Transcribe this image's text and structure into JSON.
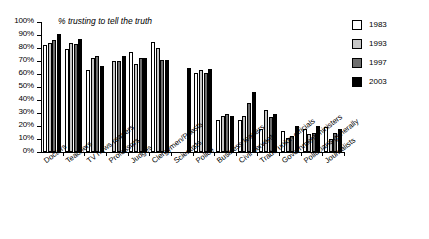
{
  "chart_data": {
    "type": "bar",
    "title": "% trusting to tell the truth",
    "xlabel": "",
    "ylabel": "",
    "ylim": [
      0,
      100
    ],
    "ytick_labels": [
      "100%",
      "90%",
      "80%",
      "70%",
      "60%",
      "50%",
      "40%",
      "30%",
      "20%",
      "10%",
      "0%"
    ],
    "ytick_values": [
      100,
      90,
      80,
      70,
      60,
      50,
      40,
      30,
      20,
      10,
      0
    ],
    "grid": false,
    "legend_position": "top-right",
    "categories": [
      "Doctors",
      "Teachers",
      "TV news readers",
      "Professors",
      "Judges",
      "Clergymen/Priests",
      "Scientists",
      "Police",
      "Business leaders",
      "Civil servants",
      "Trade union officials",
      "Government ministers",
      "Politicians generally",
      "Journalists"
    ],
    "series": [
      {
        "name": "1983",
        "color": "#ffffff",
        "values": [
          82,
          79,
          63,
          null,
          77,
          85,
          null,
          61,
          25,
          25,
          18,
          16,
          18,
          19
        ]
      },
      {
        "name": "1993",
        "color": "#c6c6c6",
        "values": [
          84,
          84,
          72,
          70,
          68,
          80,
          null,
          63,
          28,
          28,
          32,
          11,
          14,
          10
        ]
      },
      {
        "name": "1997",
        "color": "#6e6e6e",
        "values": [
          86,
          83,
          74,
          70,
          72,
          71,
          null,
          61,
          29,
          38,
          27,
          12,
          15,
          15
        ]
      },
      {
        "name": "2003",
        "color": "#000000",
        "values": [
          91,
          87,
          66,
          74,
          72,
          71,
          65,
          64,
          28,
          46,
          29,
          20,
          20,
          18
        ]
      }
    ]
  },
  "legend": {
    "items": [
      {
        "label": "1983",
        "swatch": "#ffffff"
      },
      {
        "label": "1993",
        "swatch": "#c6c6c6"
      },
      {
        "label": "1997",
        "swatch": "#6e6e6e"
      },
      {
        "label": "2003",
        "swatch": "#000000"
      }
    ]
  }
}
